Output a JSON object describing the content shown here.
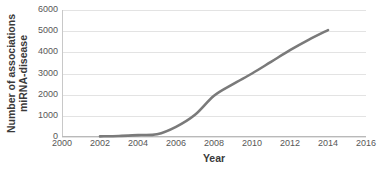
{
  "chart_data": {
    "type": "line",
    "title": "",
    "xlabel": "Year",
    "ylabel": "Number of associations miRNA-disease",
    "ylabel_lines": [
      "Number of associations",
      "miRNA-disease"
    ],
    "xlim": [
      2000,
      2016
    ],
    "ylim": [
      0,
      6000
    ],
    "xticks": [
      2000,
      2002,
      2004,
      2006,
      2008,
      2010,
      2012,
      2014,
      2016
    ],
    "yticks": [
      0,
      1000,
      2000,
      3000,
      4000,
      5000,
      6000
    ],
    "xtick_labels": [
      "2000",
      "2002",
      "2004",
      "2006",
      "2008",
      "2010",
      "2012",
      "2014",
      "2016"
    ],
    "ytick_labels": [
      "0",
      "1000",
      "2000",
      "3000",
      "4000",
      "5000",
      "6000"
    ],
    "grid": true,
    "grid_axis": "y",
    "legend": false,
    "legend_position": "none",
    "line_color": "#7a7a7a",
    "line_width": 2.6,
    "series": [
      {
        "name": "miRNA-disease associations",
        "x": [
          2002,
          2003,
          2004,
          2005,
          2006,
          2007,
          2008,
          2009,
          2010,
          2011,
          2012,
          2013,
          2014
        ],
        "values": [
          30,
          50,
          90,
          130,
          480,
          1050,
          1950,
          2500,
          3000,
          3550,
          4100,
          4600,
          5050
        ]
      }
    ]
  },
  "colors": {
    "background": "#ffffff",
    "gridline": "#e3e3e3",
    "axis": "#b9b9b9",
    "tick_text": "#575757",
    "title_text": "#3a3a3a",
    "series": "#7a7a7a"
  }
}
